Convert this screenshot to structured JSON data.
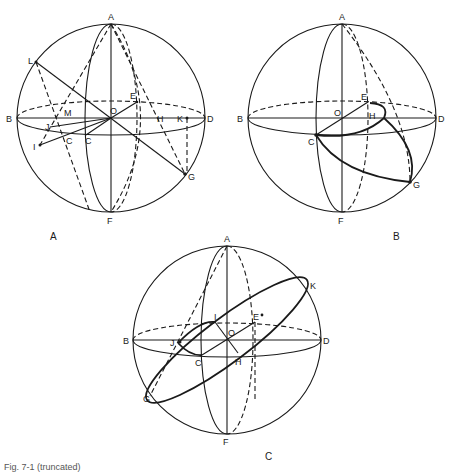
{
  "figures": [
    {
      "id": "A",
      "caption": "A",
      "points": [
        "A",
        "B",
        "C",
        "C",
        "D",
        "E",
        "F",
        "G",
        "H",
        "I",
        "J",
        "K",
        "L",
        "M",
        "O"
      ]
    },
    {
      "id": "B",
      "caption": "B",
      "points": [
        "A",
        "B",
        "C",
        "D",
        "E",
        "F",
        "G",
        "H",
        "O"
      ]
    },
    {
      "id": "C",
      "caption": "C",
      "points": [
        "A",
        "B",
        "C",
        "D",
        "E",
        "F",
        "G",
        "H",
        "I",
        "J",
        "K",
        "O"
      ]
    }
  ],
  "labels": {
    "A": "A",
    "B": "B",
    "C": "C",
    "D": "D",
    "E": "E",
    "F": "F",
    "G": "G",
    "H": "H",
    "I": "I",
    "J": "J",
    "K": "K",
    "L": "L",
    "M": "M",
    "O": "O"
  },
  "panel_captions": {
    "a": "A",
    "b": "B",
    "c": "C"
  },
  "figure_caption": "Fig. 7-1 (truncated)"
}
